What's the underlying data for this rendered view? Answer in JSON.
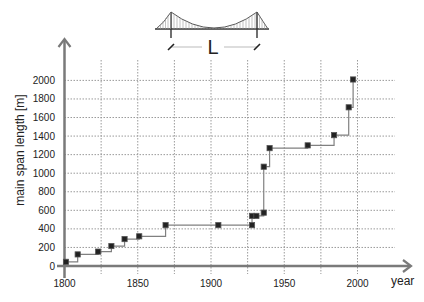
{
  "chart_data": {
    "type": "line",
    "subtype": "step",
    "title": "",
    "xlabel": "year",
    "ylabel": "main span length [m]",
    "xlim": [
      1800,
      2030
    ],
    "ylim": [
      0,
      2100
    ],
    "x_ticks": [
      1800,
      1850,
      1900,
      1950,
      2000
    ],
    "y_ticks": [
      0,
      200,
      400,
      600,
      800,
      1000,
      1200,
      1400,
      1600,
      1800,
      2000
    ],
    "x_grid": [
      1825,
      1850,
      1875,
      1900,
      1925,
      1950,
      1975,
      2000
    ],
    "grid": true,
    "grid_style": "dotted",
    "legend": null,
    "series": [
      {
        "name": "record main span length",
        "marker": "square",
        "x": [
          1801,
          1809,
          1823,
          1832,
          1841,
          1851,
          1869,
          1905,
          1928,
          1928,
          1931,
          1936,
          1936,
          1940,
          1966,
          1984,
          1994,
          1997
        ],
        "values": [
          45,
          125,
          155,
          215,
          290,
          320,
          440,
          440,
          440,
          540,
          540,
          575,
          1070,
          1270,
          1300,
          1410,
          1710,
          2010
        ]
      }
    ],
    "annotation": {
      "illustration": "suspension-bridge",
      "label": "L"
    }
  },
  "colors": {
    "axis": "#7a7a7a",
    "grid": "#9a9a9a",
    "line": "#808080",
    "marker_fill": "#222222",
    "marker_stroke": "#555555",
    "text": "#222222"
  }
}
